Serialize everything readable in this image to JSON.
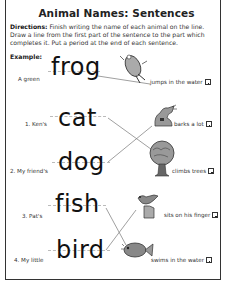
{
  "worksheet": {
    "title": "Animal Names: Sentences",
    "directions_label": "Directions:",
    "directions_text": " Finish writing the name of each animal on the line. Draw a line from the first part of the sentence to the part which completes it. Put a period at the end of each sentence.",
    "example_label": "Example:",
    "example": {
      "left": "A green",
      "word": "frog",
      "right": "jumps in the water",
      "picture": "frog-icon"
    },
    "items": [
      {
        "left": "1. Ken's",
        "word": "cat",
        "right": "barks a lot",
        "picture": "dog-icon"
      },
      {
        "left": "2. My friend's",
        "word": "dog",
        "right": "climbs trees",
        "picture": "tree-icon"
      },
      {
        "left": "3. Pat's",
        "word": "fish",
        "right": "sits on his finger",
        "picture": "bird-icon"
      },
      {
        "left": "4. My little",
        "word": "bird",
        "right": "swims in the water",
        "picture": "fish-icon"
      }
    ],
    "colors": {
      "text": "#222222",
      "border": "#333333",
      "guide_line": "#bbbbbb",
      "match_line": "#777777"
    }
  }
}
